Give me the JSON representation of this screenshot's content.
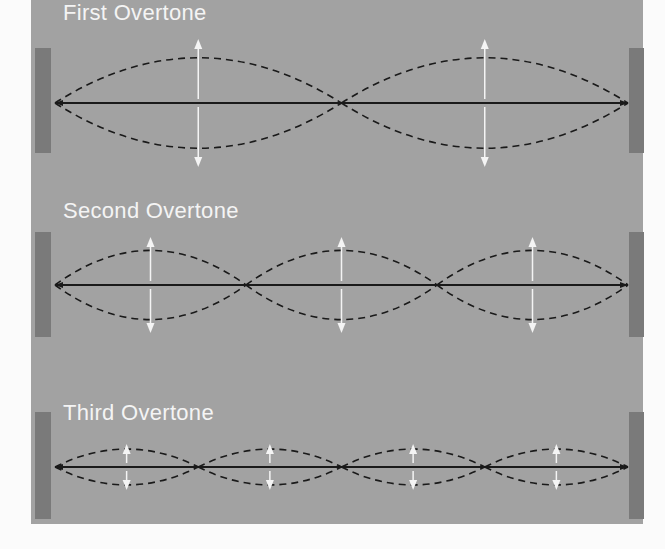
{
  "figure": {
    "background": "#fbfbfb",
    "panel_color": "#a2a2a2",
    "wall_color": "#7a7a7a",
    "string_color": "#1a1a1a",
    "arrow_color": "#f4f4f4"
  },
  "diagrams": [
    {
      "label": "First Overtone",
      "loops": 2,
      "y": 103,
      "amp": 68,
      "label_y": 2,
      "wall_top": 48,
      "wall_bottom": 153
    },
    {
      "label": "Second Overtone",
      "loops": 3,
      "y": 285,
      "amp": 52,
      "label_y": 198,
      "wall_top": 232,
      "wall_bottom": 337
    },
    {
      "label": "Third Overtone",
      "loops": 4,
      "y": 467,
      "amp": 27,
      "label_y": 402,
      "wall_top": 412,
      "wall_bottom": 519
    }
  ],
  "string": {
    "x_start": 55,
    "x_end": 628
  }
}
